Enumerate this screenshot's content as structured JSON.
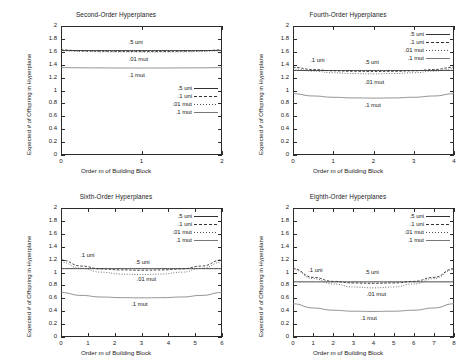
{
  "figure": {
    "axis_labels": {
      "y": "Expected # of Offspring in Hyperplane",
      "x": "Order m of Building Block"
    },
    "y_ticks": [
      "0",
      "0.2",
      "0.4",
      "0.6",
      "0.8",
      "1",
      "1.2",
      "1.4",
      "1.6",
      "1.8",
      "2"
    ],
    "legend_entries": [
      {
        "label": ".5 uni",
        "style": "solid"
      },
      {
        "label": ".1 uni",
        "style": "dashed"
      },
      {
        "label": ".01 mut",
        "style": "dotted"
      },
      {
        "label": ".1 mut",
        "style": "thin"
      }
    ],
    "colors": {
      "frame": "#2b2b2b",
      "text": "#1a1a1a",
      "series_solid": "#333333",
      "series_dashed": "#333333",
      "series_dotted": "#555555",
      "series_thin": "#777777",
      "background": "#ffffff"
    }
  },
  "chart_data": [
    {
      "type": "line",
      "title": "Second-Order Hyperplanes",
      "xlabel": "Order m of Building Block",
      "ylabel": "Expected # of Offspring in Hyperplane",
      "xlim": [
        0,
        2
      ],
      "ylim": [
        0,
        2
      ],
      "x_ticks": [
        "0",
        "1",
        "2"
      ],
      "y_ticks": [
        "0",
        "0.2",
        "0.4",
        "0.6",
        "0.8",
        "1",
        "1.2",
        "1.4",
        "1.6",
        "1.8",
        "2"
      ],
      "grid": false,
      "legend_position": "inside-right-middle",
      "x": [
        0,
        0.25,
        0.5,
        0.75,
        1,
        1.25,
        1.5,
        1.75,
        2
      ],
      "series": [
        {
          "name": ".5 uni",
          "style": "solid",
          "values": [
            1.62,
            1.62,
            1.62,
            1.62,
            1.62,
            1.62,
            1.62,
            1.62,
            1.62
          ]
        },
        {
          "name": ".1 uni",
          "style": "dashed",
          "values": [
            1.63,
            1.615,
            1.608,
            1.605,
            1.604,
            1.605,
            1.608,
            1.615,
            1.63
          ]
        },
        {
          "name": ".01 mut",
          "style": "dotted",
          "values": [
            1.615,
            1.605,
            1.6,
            1.598,
            1.597,
            1.598,
            1.6,
            1.605,
            1.615
          ]
        },
        {
          "name": ".1 mut",
          "style": "thin",
          "values": [
            1.355,
            1.352,
            1.35,
            1.349,
            1.348,
            1.349,
            1.35,
            1.352,
            1.355
          ]
        }
      ],
      "annotations": [
        {
          "text": ".5 uni",
          "x": 1.0,
          "y": 1.74
        },
        {
          "text": ".01 mut",
          "x": 1.0,
          "y": 1.48
        },
        {
          "text": ".1 mut",
          "x": 1.0,
          "y": 1.22
        }
      ]
    },
    {
      "type": "line",
      "title": "Fourth-Order Hyperplanes",
      "xlabel": "Order m of Building Block",
      "ylabel": "Expected # of Offspring in Hyperplane",
      "xlim": [
        0,
        4
      ],
      "ylim": [
        0,
        2
      ],
      "x_ticks": [
        "0",
        "1",
        "2",
        "3",
        "4"
      ],
      "y_ticks": [
        "0",
        "0.2",
        "0.4",
        "0.6",
        "0.8",
        "1",
        "1.2",
        "1.4",
        "1.6",
        "1.8",
        "2"
      ],
      "grid": false,
      "legend_position": "inside-top-right",
      "x": [
        0,
        0.5,
        1,
        1.5,
        2,
        2.5,
        3,
        3.5,
        4
      ],
      "series": [
        {
          "name": ".5 uni",
          "style": "solid",
          "values": [
            1.31,
            1.31,
            1.31,
            1.31,
            1.31,
            1.31,
            1.31,
            1.31,
            1.31
          ]
        },
        {
          "name": ".1 uni",
          "style": "dashed",
          "values": [
            1.36,
            1.325,
            1.305,
            1.297,
            1.295,
            1.297,
            1.305,
            1.325,
            1.36
          ]
        },
        {
          "name": ".01 mut",
          "style": "dotted",
          "values": [
            1.335,
            1.3,
            1.275,
            1.262,
            1.258,
            1.262,
            1.275,
            1.3,
            1.335
          ]
        },
        {
          "name": ".1 mut",
          "style": "thin",
          "values": [
            0.95,
            0.915,
            0.895,
            0.885,
            0.882,
            0.885,
            0.895,
            0.915,
            0.95
          ]
        }
      ],
      "annotations": [
        {
          "text": ".1 uni",
          "x": 0.75,
          "y": 1.45
        },
        {
          "text": ".5 uni",
          "x": 2.1,
          "y": 1.42
        },
        {
          "text": ".01 mut",
          "x": 2.1,
          "y": 1.12
        },
        {
          "text": ".1 mut",
          "x": 2.1,
          "y": 0.76
        }
      ]
    },
    {
      "type": "line",
      "title": "Sixth-Order Hyperplanes",
      "xlabel": "Order m of Building Block",
      "ylabel": "Expected # of Offspring in Hyperplane",
      "xlim": [
        0,
        6
      ],
      "ylim": [
        0,
        2
      ],
      "x_ticks": [
        "0",
        "1",
        "2",
        "3",
        "4",
        "5",
        "6"
      ],
      "y_ticks": [
        "0",
        "0.2",
        "0.4",
        "0.6",
        "0.8",
        "1",
        "1.2",
        "1.4",
        "1.6",
        "1.8",
        "2"
      ],
      "grid": false,
      "legend_position": "inside-top-right",
      "x": [
        0,
        0.75,
        1.5,
        2.25,
        3,
        3.75,
        4.5,
        5.25,
        6
      ],
      "series": [
        {
          "name": ".5 uni",
          "style": "solid",
          "values": [
            1.06,
            1.06,
            1.06,
            1.06,
            1.06,
            1.06,
            1.06,
            1.06,
            1.06
          ]
        },
        {
          "name": ".1 uni",
          "style": "dashed",
          "values": [
            1.195,
            1.1,
            1.055,
            1.04,
            1.035,
            1.04,
            1.055,
            1.1,
            1.195
          ]
        },
        {
          "name": ".01 mut",
          "style": "dotted",
          "values": [
            1.16,
            1.065,
            1.005,
            0.975,
            0.968,
            0.975,
            1.005,
            1.065,
            1.16
          ]
        },
        {
          "name": ".1 mut",
          "style": "thin",
          "values": [
            0.69,
            0.645,
            0.62,
            0.61,
            0.607,
            0.61,
            0.62,
            0.645,
            0.69
          ]
        }
      ],
      "annotations": [
        {
          "text": ".1 uni",
          "x": 1.2,
          "y": 1.25
        },
        {
          "text": ".5 uni",
          "x": 3.25,
          "y": 1.15
        },
        {
          "text": ".01 mut",
          "x": 3.3,
          "y": 0.885
        },
        {
          "text": ".1 mut",
          "x": 3.1,
          "y": 0.49
        }
      ]
    },
    {
      "type": "line",
      "title": "Eighth-Order Hyperplanes",
      "xlabel": "Order m of Building Block",
      "ylabel": "Expected # of Offspring in Hyperplane",
      "xlim": [
        0,
        8
      ],
      "ylim": [
        0,
        2
      ],
      "x_ticks": [
        "0",
        "1",
        "2",
        "3",
        "4",
        "5",
        "6",
        "7",
        "8"
      ],
      "y_ticks": [
        "0",
        "0.2",
        "0.4",
        "0.6",
        "0.8",
        "1",
        "1.2",
        "1.4",
        "1.6",
        "1.8",
        "2"
      ],
      "grid": false,
      "legend_position": "inside-top-right",
      "x": [
        0,
        1,
        2,
        3,
        4,
        5,
        6,
        7,
        8
      ],
      "series": [
        {
          "name": ".5 uni",
          "style": "solid",
          "values": [
            0.855,
            0.855,
            0.855,
            0.855,
            0.855,
            0.855,
            0.855,
            0.855,
            0.855
          ]
        },
        {
          "name": ".1 uni",
          "style": "dashed",
          "values": [
            1.06,
            0.925,
            0.862,
            0.838,
            0.832,
            0.838,
            0.862,
            0.925,
            1.06
          ]
        },
        {
          "name": ".01 mut",
          "style": "dotted",
          "values": [
            1.045,
            0.905,
            0.822,
            0.775,
            0.762,
            0.775,
            0.822,
            0.905,
            1.045
          ]
        },
        {
          "name": ".1 mut",
          "style": "thin",
          "values": [
            0.515,
            0.45,
            0.415,
            0.4,
            0.396,
            0.4,
            0.415,
            0.45,
            0.515
          ]
        }
      ],
      "annotations": [
        {
          "text": ".1 uni",
          "x": 1.4,
          "y": 1.02
        },
        {
          "text": ".5 uni",
          "x": 4.2,
          "y": 0.99
        },
        {
          "text": ".01 mut",
          "x": 4.3,
          "y": 0.655
        },
        {
          "text": ".1 mut",
          "x": 4.0,
          "y": 0.285
        }
      ]
    }
  ]
}
